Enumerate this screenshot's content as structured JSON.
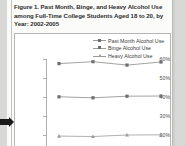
{
  "figure": {
    "title": "Figure 1. Past Month, Binge, and Heavy Alcohol Use among Full-Time College Students Aged 18 to 20, by Year: 2002-2005"
  },
  "chart_data": {
    "type": "line",
    "title": "Figure 1. Past Month, Binge, and Heavy Alcohol Use among Full-Time College Students Aged 18 to 20, by Year: 2002-2005",
    "xlabel": "",
    "ylabel": "",
    "categories": [
      "2002",
      "2003",
      "2004",
      "2005"
    ],
    "ytick_labels": [
      "60%",
      "50%",
      "40%",
      "30%",
      "20%"
    ],
    "ytick_values": [
      60,
      50,
      40,
      30,
      20
    ],
    "ylim": [
      18,
      62
    ],
    "grid": false,
    "legend_position": "top-right",
    "note": "Bottom of the chart is cropped by the screenshot edge; the Heavy Alcohol Use series is only partially visible.",
    "series": [
      {
        "name": "Past Month Alcohol Use",
        "marker": "square",
        "color": "#8a8a88",
        "values": [
          57.6,
          58.6,
          56.8,
          58.4
        ]
      },
      {
        "name": "Binge Alcohol Use",
        "marker": "square",
        "color": "#8a8a88",
        "values": [
          40.1,
          39.6,
          40.4,
          40.5
        ]
      },
      {
        "name": "Heavy Alcohol Use",
        "marker": "triangle",
        "color": "#9c9c9a",
        "values": [
          19.4,
          19.2,
          20.0,
          20.1
        ]
      }
    ]
  },
  "legend": {
    "items": [
      {
        "label": "Past Month Alcohol Use",
        "marker": "square"
      },
      {
        "label": "Binge Alcohol Use",
        "marker": "square"
      },
      {
        "label": "Heavy Alcohol Use",
        "marker": "triangle"
      }
    ]
  },
  "yaxis": {
    "ticks": [
      {
        "label": "60%"
      },
      {
        "label": "50%"
      },
      {
        "label": "40%"
      },
      {
        "label": "30%"
      },
      {
        "label": "20%"
      }
    ]
  }
}
